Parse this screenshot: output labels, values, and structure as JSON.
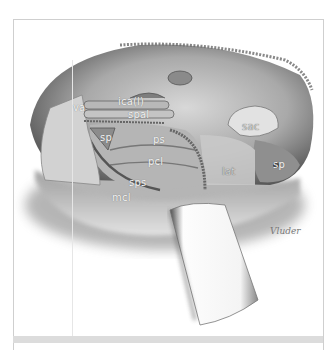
{
  "figure": {
    "labels": [
      {
        "id": "va",
        "text": "va",
        "x": 73,
        "y": 103
      },
      {
        "id": "ica",
        "text": "ica(l)",
        "x": 118,
        "y": 97
      },
      {
        "id": "spal",
        "text": "spal",
        "x": 128,
        "y": 110
      },
      {
        "id": "sp-left",
        "text": "sp",
        "x": 100,
        "y": 133
      },
      {
        "id": "ps",
        "text": "ps",
        "x": 153,
        "y": 135
      },
      {
        "id": "pcl",
        "text": "pcl",
        "x": 148,
        "y": 157
      },
      {
        "id": "sps",
        "text": "sps",
        "x": 129,
        "y": 178
      },
      {
        "id": "mcl",
        "text": "mcl",
        "x": 112,
        "y": 193
      },
      {
        "id": "sac",
        "text": "sac",
        "x": 242,
        "y": 122
      },
      {
        "id": "lat",
        "text": "lat",
        "x": 222,
        "y": 167
      },
      {
        "id": "sp-right",
        "text": "sp",
        "x": 273,
        "y": 160
      }
    ],
    "signature": "Vluder"
  }
}
